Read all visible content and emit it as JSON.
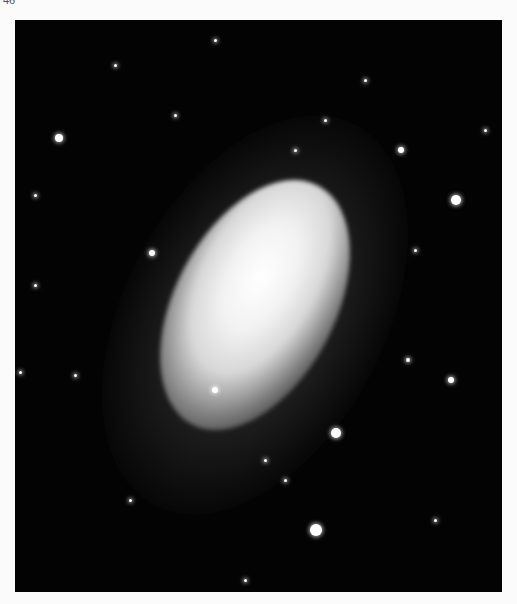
{
  "page": {
    "page_number": "46"
  },
  "stars": [
    {
      "x": 44,
      "y": 118,
      "r": 4
    },
    {
      "x": 386,
      "y": 130,
      "r": 3
    },
    {
      "x": 441,
      "y": 180,
      "r": 5
    },
    {
      "x": 137,
      "y": 233,
      "r": 3
    },
    {
      "x": 393,
      "y": 340,
      "r": 2
    },
    {
      "x": 436,
      "y": 360,
      "r": 3
    },
    {
      "x": 200,
      "y": 370,
      "r": 3
    },
    {
      "x": 321,
      "y": 413,
      "r": 5
    },
    {
      "x": 301,
      "y": 510,
      "r": 6
    },
    {
      "x": 100,
      "y": 45,
      "r": 1.5
    },
    {
      "x": 200,
      "y": 20,
      "r": 1.5
    },
    {
      "x": 310,
      "y": 100,
      "r": 1.5
    },
    {
      "x": 20,
      "y": 175,
      "r": 1.5
    },
    {
      "x": 60,
      "y": 355,
      "r": 1.5
    },
    {
      "x": 5,
      "y": 352,
      "r": 1.5
    },
    {
      "x": 115,
      "y": 480,
      "r": 1.5
    },
    {
      "x": 230,
      "y": 560,
      "r": 1.5
    },
    {
      "x": 420,
      "y": 500,
      "r": 1.5
    },
    {
      "x": 470,
      "y": 110,
      "r": 1.5
    },
    {
      "x": 160,
      "y": 95,
      "r": 1.5
    },
    {
      "x": 280,
      "y": 130,
      "r": 1.5
    },
    {
      "x": 250,
      "y": 440,
      "r": 1.5
    },
    {
      "x": 270,
      "y": 460,
      "r": 1.5
    },
    {
      "x": 350,
      "y": 60,
      "r": 1.5
    },
    {
      "x": 400,
      "y": 230,
      "r": 1.5
    },
    {
      "x": 20,
      "y": 265,
      "r": 1.5
    }
  ]
}
